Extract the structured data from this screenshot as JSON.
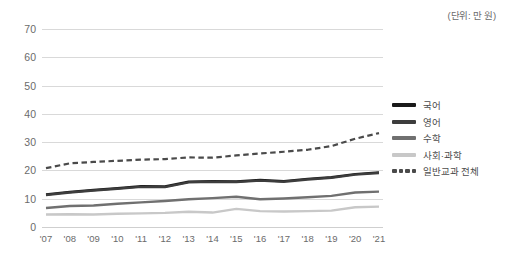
{
  "unit_note": "(단위: 만 원)",
  "legend": {
    "position": "right",
    "items": [
      {
        "label": "국어",
        "color": "#1a1a1a",
        "style": "solid"
      },
      {
        "label": "영어",
        "color": "#3d3d3d",
        "style": "solid"
      },
      {
        "label": "수학",
        "color": "#707070",
        "style": "solid"
      },
      {
        "label": "사회·과학",
        "color": "#c8c8c8",
        "style": "solid"
      },
      {
        "label": "일반교과 전체",
        "color": "#4a4a4a",
        "style": "dashed"
      }
    ]
  },
  "chart_data": {
    "type": "line",
    "title": "",
    "subtitle": "",
    "xlabel": "",
    "ylabel": "",
    "unit": "(단위: 만 원)",
    "grid": true,
    "legend_position": "right",
    "xlim": [
      "'07",
      "'21"
    ],
    "ylim": [
      0,
      70
    ],
    "yticks": [
      0,
      10,
      20,
      30,
      40,
      50,
      60,
      70
    ],
    "categories": [
      "'07",
      "'08",
      "'09",
      "'10",
      "'11",
      "'12",
      "'13",
      "'14",
      "'15",
      "'16",
      "'17",
      "'18",
      "'19",
      "'20",
      "'21"
    ],
    "series": [
      {
        "name": "국어",
        "color": "#1a1a1a",
        "style": "solid",
        "values": [
          11.5,
          12.4,
          13.1,
          13.7,
          14.4,
          14.3,
          16.0,
          16.2,
          16.1,
          16.6,
          16.2,
          17.0,
          17.6,
          18.7,
          19.3
        ]
      },
      {
        "name": "영어",
        "color": "#3d3d3d",
        "style": "solid",
        "values": [
          11.3,
          12.2,
          12.9,
          13.5,
          14.2,
          14.1,
          15.8,
          16.0,
          15.9,
          16.4,
          16.0,
          16.8,
          17.4,
          18.5,
          19.1
        ]
      },
      {
        "name": "수학",
        "color": "#707070",
        "style": "solid",
        "values": [
          6.7,
          7.4,
          7.6,
          8.2,
          8.7,
          9.2,
          9.8,
          10.2,
          10.7,
          9.8,
          10.1,
          10.5,
          11.0,
          12.2,
          12.5
        ]
      },
      {
        "name": "사회·과학",
        "color": "#c8c8c8",
        "style": "solid",
        "values": [
          4.4,
          4.5,
          4.4,
          4.7,
          4.8,
          5.0,
          5.4,
          5.1,
          6.4,
          5.6,
          5.5,
          5.6,
          5.8,
          7.0,
          7.2
        ]
      },
      {
        "name": "일반교과 전체",
        "color": "#4a4a4a",
        "style": "dashed",
        "values": [
          20.8,
          22.5,
          23.0,
          23.4,
          23.8,
          24.0,
          24.6,
          24.5,
          25.3,
          26.0,
          26.6,
          27.3,
          28.6,
          31.2,
          33.2
        ]
      }
    ]
  }
}
